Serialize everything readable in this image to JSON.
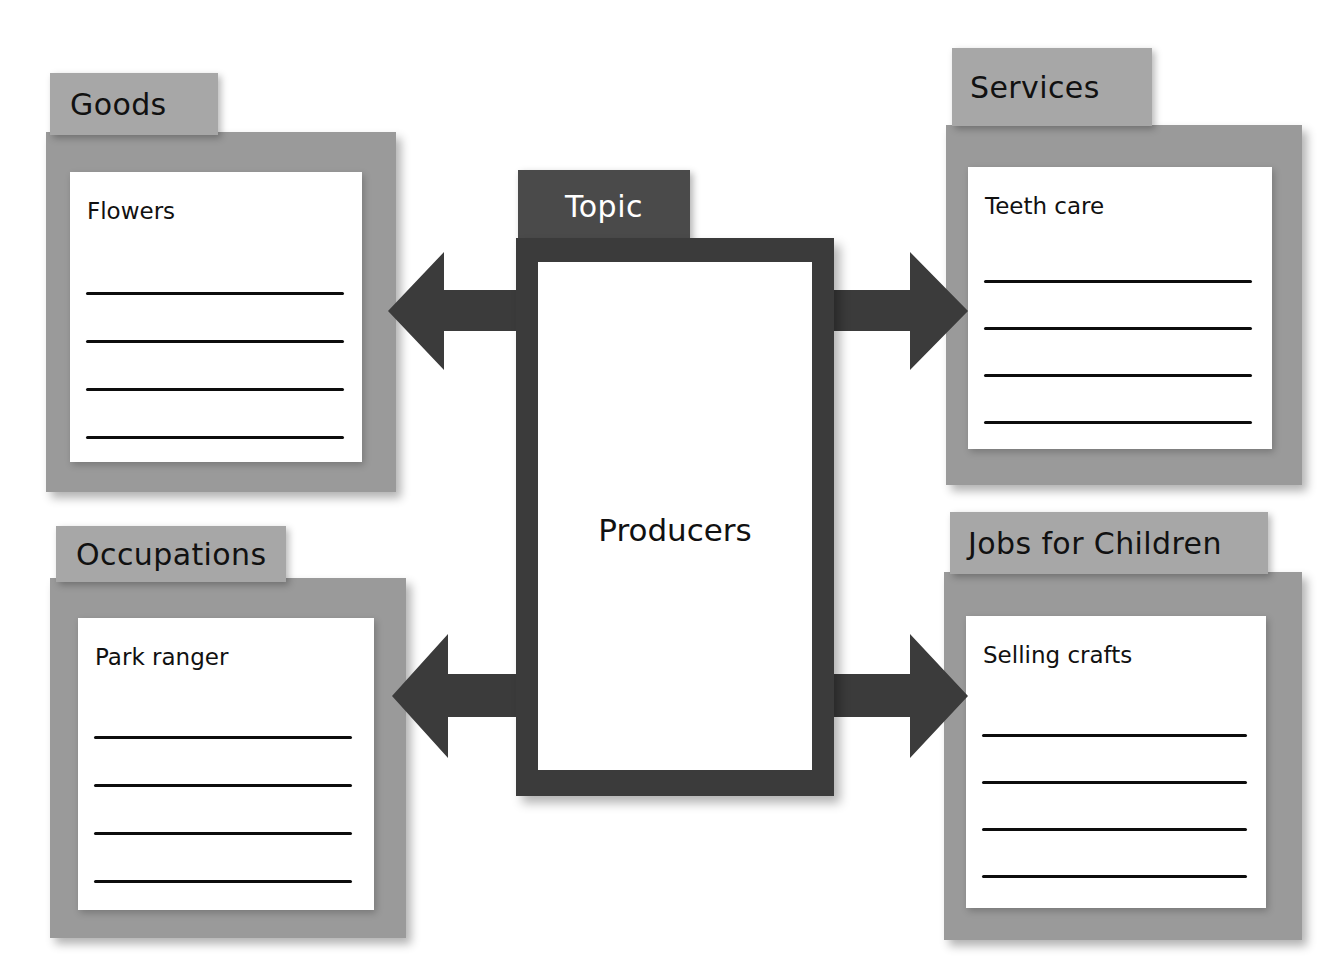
{
  "page": {
    "type": "graphic-organizer-worksheet",
    "layout": "four-corner-web-with-center-topic",
    "background_color": "#ffffff"
  },
  "palette": {
    "card_back": "#9a9a9a",
    "card_tab": "#a7a7a7",
    "paper": "#ffffff",
    "rule_line": "#0d0d0d",
    "topic_border": "#3b3b3b",
    "topic_tab": "#4a4a4a",
    "topic_tab_text": "#ffffff",
    "arrow": "#3b3b3b",
    "body_text": "#111111"
  },
  "center": {
    "tab_label": "Topic",
    "topic_word": "Producers",
    "rule_count": 0
  },
  "cards": [
    {
      "id": "goods",
      "position": "top-left",
      "tab_label": "Goods",
      "entry": "Flowers",
      "rule_count": 4
    },
    {
      "id": "services",
      "position": "top-right",
      "tab_label": "Services",
      "entry": "Teeth care",
      "rule_count": 4
    },
    {
      "id": "occupations",
      "position": "bottom-left",
      "tab_label": "Occupations",
      "entry": "Park ranger",
      "rule_count": 4
    },
    {
      "id": "jobs-for-children",
      "position": "bottom-right",
      "tab_label": "Jobs for Children",
      "entry": "Selling crafts",
      "rule_count": 4
    }
  ],
  "arrows": [
    {
      "id": "center-to-goods",
      "direction": "left",
      "from": "Topic",
      "to": "Goods"
    },
    {
      "id": "center-to-services",
      "direction": "right",
      "from": "Topic",
      "to": "Services"
    },
    {
      "id": "center-to-occupations",
      "direction": "left",
      "from": "Topic",
      "to": "Occupations"
    },
    {
      "id": "center-to-jobs-for-children",
      "direction": "right",
      "from": "Topic",
      "to": "Jobs for Children"
    }
  ]
}
